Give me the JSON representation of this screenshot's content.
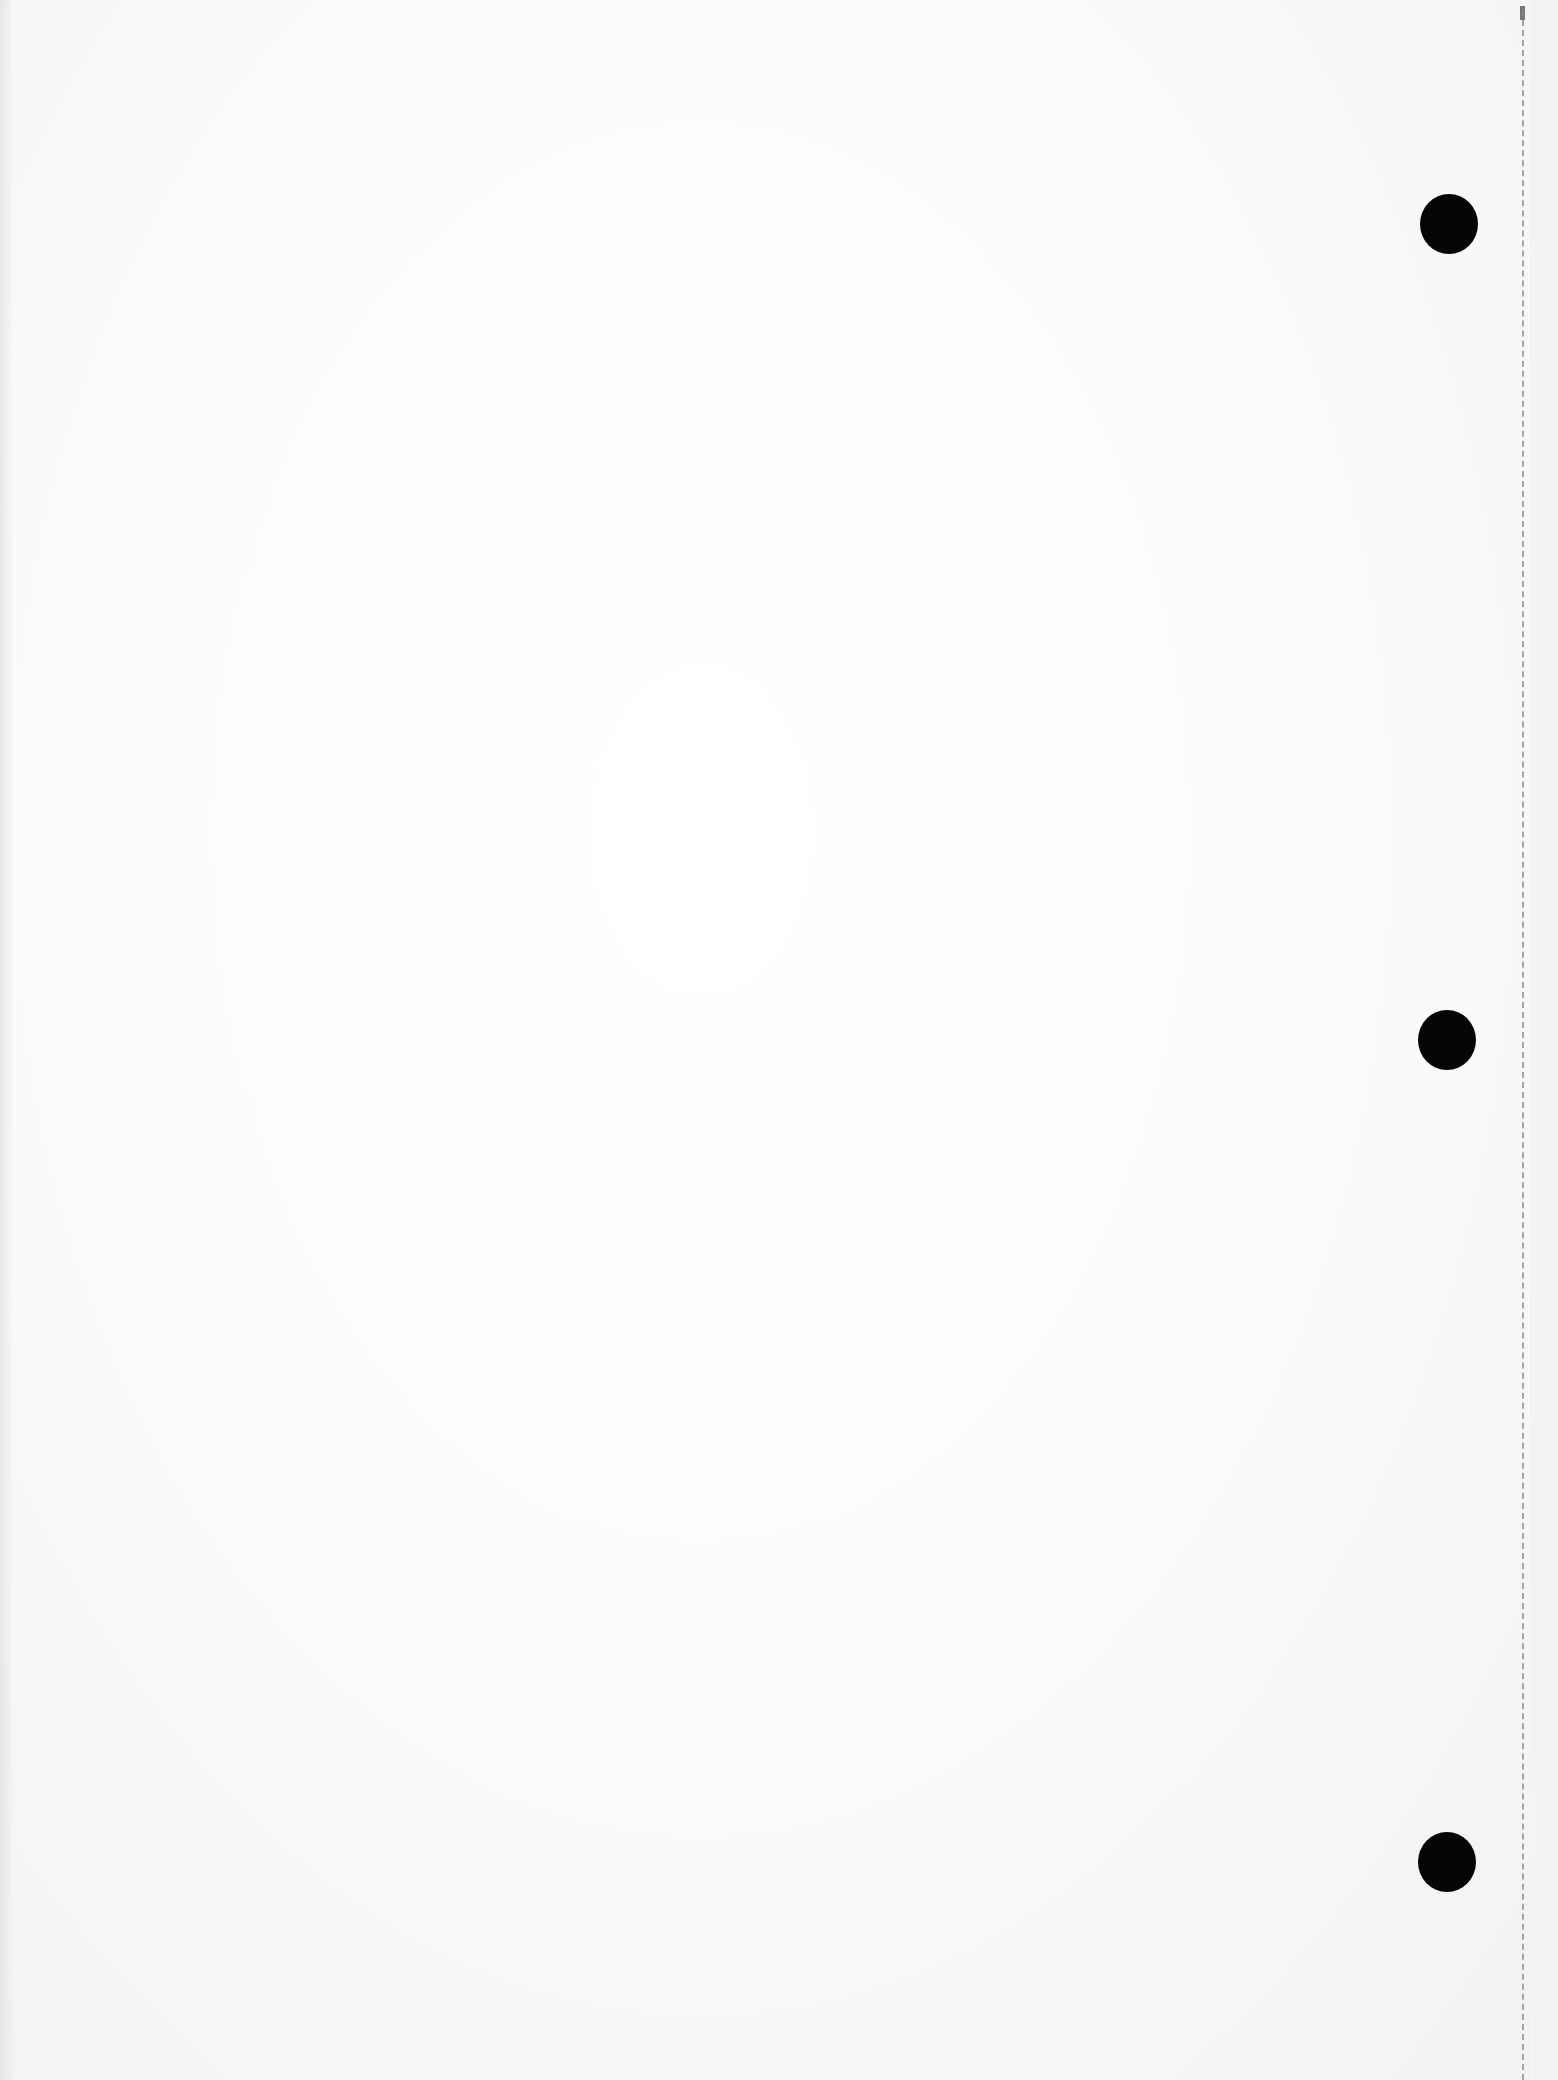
{
  "document": {
    "type": "blank scanned loose-leaf page",
    "text_content": "",
    "hole_punches": 3,
    "has_perforated_edge": true,
    "colors": {
      "paper": "#ffffff",
      "hole": "#050505",
      "perforation": "#8a8a8a"
    }
  }
}
